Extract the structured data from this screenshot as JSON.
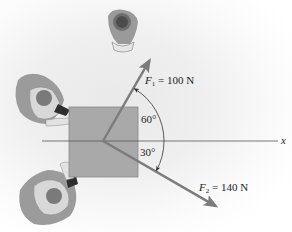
{
  "diagram": {
    "axis_label": "x",
    "forces": [
      {
        "symbol": "F",
        "subscript": "1",
        "equals_value": " = 100 N",
        "magnitude_N": 100,
        "angle_deg": 60,
        "direction": "above x-axis"
      },
      {
        "symbol": "F",
        "subscript": "2",
        "equals_value": " = 140 N",
        "magnitude_N": 140,
        "angle_deg": 30,
        "direction": "below x-axis"
      }
    ],
    "angle_labels": [
      "60°",
      "30°"
    ],
    "colors": {
      "box": "#a9a9a9",
      "vector": "#7b7b7b",
      "axis": "#555555"
    },
    "figures": [
      "person-top",
      "person-left-upper",
      "person-left-lower"
    ]
  }
}
